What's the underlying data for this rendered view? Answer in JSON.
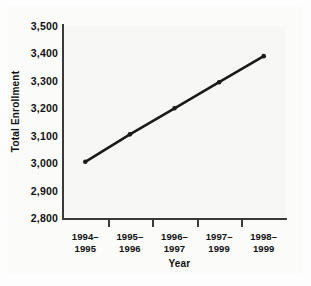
{
  "chart_data": {
    "type": "line",
    "title": "",
    "xlabel": "Year",
    "ylabel": "Total Enrollment",
    "categories": [
      "1994–1995",
      "1995–1996",
      "1996–1997",
      "1997–1999",
      "1998–1999"
    ],
    "category_lines": [
      [
        "1994–",
        "1995"
      ],
      [
        "1995–",
        "1996"
      ],
      [
        "1996–",
        "1997"
      ],
      [
        "1997–",
        "1999"
      ],
      [
        "1998–",
        "1999"
      ]
    ],
    "values": [
      3005,
      3105,
      3200,
      3295,
      3390
    ],
    "ylim": [
      2800,
      3500
    ],
    "yticks": [
      2800,
      2900,
      3000,
      3100,
      3200,
      3300,
      3400,
      3500
    ],
    "ytick_labels": [
      "2,800",
      "2,900",
      "3,000",
      "3,100",
      "3,200",
      "3,300",
      "3,400",
      "3,500"
    ],
    "grid": false,
    "legend": "none",
    "marker": "circle",
    "line_color": "#1a1a1a",
    "marker_color": "#1a1a1a",
    "axis_color": "#3a3a3a",
    "plot_background": "#f7f7f6"
  }
}
